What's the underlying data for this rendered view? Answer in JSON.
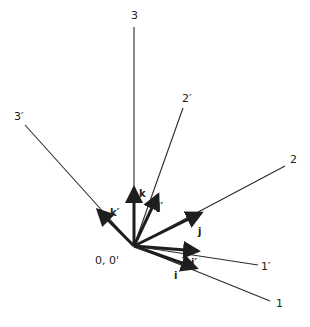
{
  "diagram": {
    "origin": {
      "label": "0, 0'",
      "x": 134,
      "y": 246,
      "label_x": 95,
      "label_y": 264
    },
    "colors": {
      "line": "#2a2a2a",
      "vector": "#1e1e1e",
      "background": "#ffffff"
    },
    "axes": [
      {
        "id": "axis-3",
        "label": "3",
        "end": [
          134,
          27
        ],
        "label_pos": [
          131,
          19
        ]
      },
      {
        "id": "axis-3p",
        "label": "3′",
        "end": [
          25,
          125
        ],
        "label_pos": [
          14,
          120
        ]
      },
      {
        "id": "axis-2p",
        "label": "2′",
        "end": [
          183,
          108
        ],
        "label_pos": [
          182,
          102
        ]
      },
      {
        "id": "axis-2",
        "label": "2",
        "end": [
          285,
          166
        ],
        "label_pos": [
          290,
          163
        ]
      },
      {
        "id": "axis-1p",
        "label": "1′",
        "end": [
          258,
          265
        ],
        "label_pos": [
          261,
          270
        ]
      },
      {
        "id": "axis-1",
        "label": "1",
        "end": [
          270,
          301
        ],
        "label_pos": [
          276,
          307
        ]
      }
    ],
    "unit_vectors": [
      {
        "id": "vec-k",
        "label": "k",
        "tip": [
          134,
          188
        ],
        "label_pos": [
          139,
          197
        ]
      },
      {
        "id": "vec-kp",
        "label": "k′",
        "tip": [
          98,
          210
        ],
        "label_pos": [
          110,
          216
        ]
      },
      {
        "id": "vec-jp",
        "label": "j′",
        "tip": [
          158,
          195
        ],
        "label_pos": [
          157,
          210
        ]
      },
      {
        "id": "vec-j",
        "label": "j",
        "tip": [
          201,
          213
        ],
        "label_pos": [
          198,
          235
        ]
      },
      {
        "id": "vec-ip",
        "label": "i′",
        "tip": [
          198,
          251
        ],
        "label_pos": [
          191,
          266
        ]
      },
      {
        "id": "vec-i",
        "label": "i",
        "tip": [
          196,
          268
        ],
        "label_pos": [
          174,
          279
        ]
      }
    ]
  }
}
